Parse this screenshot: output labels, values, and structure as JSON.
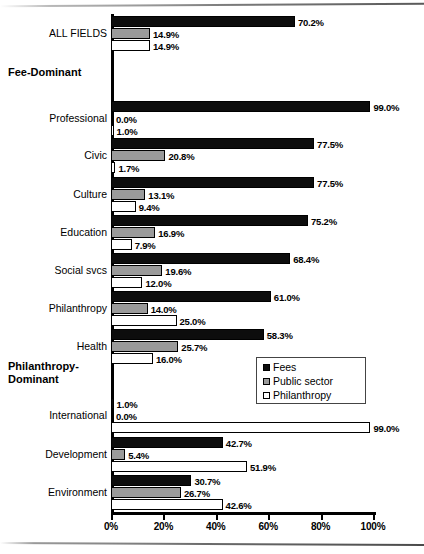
{
  "chart_data": {
    "type": "bar",
    "orientation": "horizontal",
    "title": "",
    "xlabel": "",
    "ylabel": "",
    "xlim": [
      0,
      100
    ],
    "grid": false,
    "legend_position": "middle-right",
    "tick_labels": [
      "0%",
      "20%",
      "40%",
      "60%",
      "80%",
      "100%"
    ],
    "tick_values": [
      0,
      20,
      40,
      60,
      80,
      100
    ],
    "series": [
      {
        "name": "Fees",
        "color": "#0d0d0d"
      },
      {
        "name": "Public sector",
        "color": "#9a9a9a"
      },
      {
        "name": "Philanthropy",
        "color": "#ffffff"
      }
    ],
    "categories": [
      "ALL FIELDS",
      "Professional",
      "Civic",
      "Culture",
      "Education",
      "Social svcs",
      "Philanthropy",
      "Health",
      "International",
      "Development",
      "Environment"
    ],
    "values": {
      "Fees": [
        70.2,
        99.0,
        77.5,
        77.5,
        75.2,
        68.4,
        61.0,
        58.3,
        1.0,
        42.7,
        30.7
      ],
      "Public sector": [
        14.9,
        0.0,
        20.8,
        13.1,
        16.9,
        19.6,
        14.0,
        25.7,
        0.0,
        5.4,
        26.7
      ],
      "Philanthropy": [
        14.9,
        1.0,
        1.7,
        9.4,
        7.9,
        12.0,
        25.0,
        16.0,
        99.0,
        51.9,
        42.6
      ]
    },
    "value_labels": {
      "Fees": [
        "70.2%",
        "99.0%",
        "77.5%",
        "77.5%",
        "75.2%",
        "68.4%",
        "61.0%",
        "58.3%",
        "1.0%",
        "42.7%",
        "30.7%"
      ],
      "Public sector": [
        "14.9%",
        "0.0%",
        "20.8%",
        "13.1%",
        "16.9%",
        "19.6%",
        "14.0%",
        "25.7%",
        "0.0%",
        "5.4%",
        "26.7%"
      ],
      "Philanthropy": [
        "14.9%",
        "1.0%",
        "1.7%",
        "9.4%",
        "7.9%",
        "12.0%",
        "25.0%",
        "16.0%",
        "99.0%",
        "51.9%",
        "42.6%"
      ]
    },
    "section_headings": [
      "Fee-Dominant",
      "Philanthropy-\nDominant"
    ],
    "annotations": []
  },
  "axis": {
    "ticks": [
      {
        "label": "0%",
        "value": 0
      },
      {
        "label": "20%",
        "value": 20
      },
      {
        "label": "40%",
        "value": 40
      },
      {
        "label": "60%",
        "value": 60
      },
      {
        "label": "80%",
        "value": 80
      },
      {
        "label": "100%",
        "value": 100
      }
    ]
  },
  "legend": {
    "items": [
      {
        "label": "Fees",
        "color": "#0d0d0d"
      },
      {
        "label": "Public sector",
        "color": "#9a9a9a"
      },
      {
        "label": "Philanthropy",
        "color": "#ffffff"
      }
    ]
  },
  "headings": {
    "fee_dominant": "Fee-Dominant",
    "philanthropy_dominant_line1": "Philanthropy-",
    "philanthropy_dominant_line2": "Dominant"
  },
  "groups": [
    {
      "label": "ALL FIELDS",
      "top": 16,
      "bars": [
        {
          "series": "Fees",
          "value": 70.2,
          "label": "70.2%"
        },
        {
          "series": "Public sector",
          "value": 14.9,
          "label": "14.9%"
        },
        {
          "series": "Philanthropy",
          "value": 14.9,
          "label": "14.9%"
        }
      ]
    },
    {
      "label": "Professional",
      "top": 101,
      "bars": [
        {
          "series": "Fees",
          "value": 99.0,
          "label": "99.0%"
        },
        {
          "series": "Public sector",
          "value": 0.0,
          "label": "0.0%"
        },
        {
          "series": "Philanthropy",
          "value": 1.0,
          "label": "1.0%"
        }
      ]
    },
    {
      "label": "Civic",
      "top": 138,
      "bars": [
        {
          "series": "Fees",
          "value": 77.5,
          "label": "77.5%"
        },
        {
          "series": "Public sector",
          "value": 20.8,
          "label": "20.8%"
        },
        {
          "series": "Philanthropy",
          "value": 1.7,
          "label": "1.7%"
        }
      ]
    },
    {
      "label": "Culture",
      "top": 177,
      "bars": [
        {
          "series": "Fees",
          "value": 77.5,
          "label": "77.5%"
        },
        {
          "series": "Public sector",
          "value": 13.1,
          "label": "13.1%"
        },
        {
          "series": "Philanthropy",
          "value": 9.4,
          "label": "9.4%"
        }
      ]
    },
    {
      "label": "Education",
      "top": 215,
      "bars": [
        {
          "series": "Fees",
          "value": 75.2,
          "label": "75.2%"
        },
        {
          "series": "Public sector",
          "value": 16.9,
          "label": "16.9%"
        },
        {
          "series": "Philanthropy",
          "value": 7.9,
          "label": "7.9%"
        }
      ]
    },
    {
      "label": "Social svcs",
      "top": 253,
      "bars": [
        {
          "series": "Fees",
          "value": 68.4,
          "label": "68.4%"
        },
        {
          "series": "Public sector",
          "value": 19.6,
          "label": "19.6%"
        },
        {
          "series": "Philanthropy",
          "value": 12.0,
          "label": "12.0%"
        }
      ]
    },
    {
      "label": "Philanthropy",
      "top": 291,
      "bars": [
        {
          "series": "Fees",
          "value": 61.0,
          "label": "61.0%"
        },
        {
          "series": "Public sector",
          "value": 14.0,
          "label": "14.0%"
        },
        {
          "series": "Philanthropy",
          "value": 25.0,
          "label": "25.0%"
        }
      ]
    },
    {
      "label": "Health",
      "top": 329,
      "bars": [
        {
          "series": "Fees",
          "value": 58.3,
          "label": "58.3%"
        },
        {
          "series": "Public sector",
          "value": 25.7,
          "label": "25.7%"
        },
        {
          "series": "Philanthropy",
          "value": 16.0,
          "label": "16.0%"
        }
      ]
    },
    {
      "label": "International",
      "top": 398,
      "bars": [
        {
          "series": "Fees",
          "value": 1.0,
          "label": "1.0%"
        },
        {
          "series": "Public sector",
          "value": 0.0,
          "label": "0.0%"
        },
        {
          "series": "Philanthropy",
          "value": 99.0,
          "label": "99.0%"
        }
      ]
    },
    {
      "label": "Development",
      "top": 437,
      "bars": [
        {
          "series": "Fees",
          "value": 42.7,
          "label": "42.7%"
        },
        {
          "series": "Public sector",
          "value": 5.4,
          "label": "5.4%"
        },
        {
          "series": "Philanthropy",
          "value": 51.9,
          "label": "51.9%"
        }
      ]
    },
    {
      "label": "Environment",
      "top": 475,
      "bars": [
        {
          "series": "Fees",
          "value": 30.7,
          "label": "30.7%"
        },
        {
          "series": "Public sector",
          "value": 26.7,
          "label": "26.7%"
        },
        {
          "series": "Philanthropy",
          "value": 42.6,
          "label": "42.6%"
        }
      ]
    }
  ],
  "layout": {
    "heading_fee_top": 66,
    "heading_phil_top": 360,
    "plot_left": 111,
    "plot_width": 262,
    "bar_height": 11,
    "bar_gap": 1
  }
}
